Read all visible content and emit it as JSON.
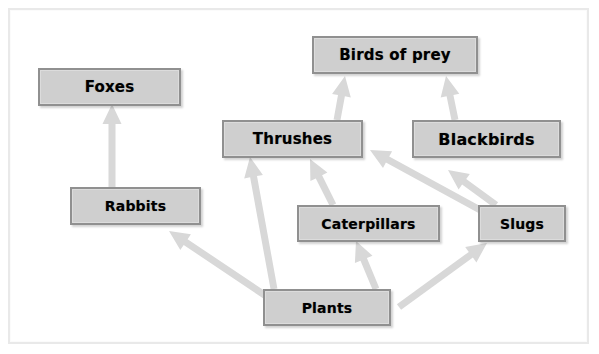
{
  "diagram": {
    "type": "food-web",
    "colors": {
      "background": "#ffffff",
      "frame_border": "#e9e9e9",
      "box_fill": "#cfcfcf",
      "box_border": "#909090",
      "box_text": "#000000",
      "arrow": "#d8d8d8"
    },
    "nodes": [
      {
        "id": "birds_of_prey",
        "label": "Birds of prey",
        "x": 312,
        "y": 36,
        "w": 166,
        "h": 38,
        "font_size": 15
      },
      {
        "id": "foxes",
        "label": "Foxes",
        "x": 38,
        "y": 68,
        "w": 143,
        "h": 38,
        "font_size": 15
      },
      {
        "id": "thrushes",
        "label": "Thrushes",
        "x": 222,
        "y": 120,
        "w": 141,
        "h": 38,
        "font_size": 15
      },
      {
        "id": "blackbirds",
        "label": "Blackbirds",
        "x": 412,
        "y": 120,
        "w": 149,
        "h": 38,
        "font_size": 16
      },
      {
        "id": "rabbits",
        "label": "Rabbits",
        "x": 70,
        "y": 187,
        "w": 131,
        "h": 38,
        "font_size": 14
      },
      {
        "id": "caterpillars",
        "label": "Caterpillars",
        "x": 297,
        "y": 205,
        "w": 143,
        "h": 37,
        "font_size": 14
      },
      {
        "id": "slugs",
        "label": "Slugs",
        "x": 478,
        "y": 205,
        "w": 88,
        "h": 37,
        "font_size": 14
      },
      {
        "id": "plants",
        "label": "Plants",
        "x": 263,
        "y": 289,
        "w": 128,
        "h": 37,
        "font_size": 14
      }
    ],
    "links": [
      {
        "from": "rabbits",
        "to": "foxes",
        "x1": 112,
        "y1": 187,
        "x2": 112,
        "y2": 104
      },
      {
        "from": "plants",
        "to": "rabbits",
        "x1": 266,
        "y1": 296,
        "x2": 169,
        "y2": 231
      },
      {
        "from": "plants",
        "to": "thrushes",
        "x1": 274,
        "y1": 289,
        "x2": 250,
        "y2": 157
      },
      {
        "from": "caterpillars",
        "to": "thrushes",
        "x1": 333,
        "y1": 205,
        "x2": 310,
        "y2": 159
      },
      {
        "from": "plants",
        "to": "caterpillars",
        "x1": 376,
        "y1": 289,
        "x2": 356,
        "y2": 241
      },
      {
        "from": "slugs",
        "to": "thrushes",
        "x1": 482,
        "y1": 211,
        "x2": 370,
        "y2": 150
      },
      {
        "from": "slugs",
        "to": "blackbirds",
        "x1": 496,
        "y1": 205,
        "x2": 448,
        "y2": 170
      },
      {
        "from": "plants",
        "to": "slugs",
        "x1": 399,
        "y1": 307,
        "x2": 487,
        "y2": 243
      },
      {
        "from": "thrushes",
        "to": "birds_of_prey",
        "x1": 337,
        "y1": 120,
        "x2": 345,
        "y2": 76
      },
      {
        "from": "blackbirds",
        "to": "birds_of_prey",
        "x1": 455,
        "y1": 120,
        "x2": 446,
        "y2": 76
      }
    ]
  }
}
